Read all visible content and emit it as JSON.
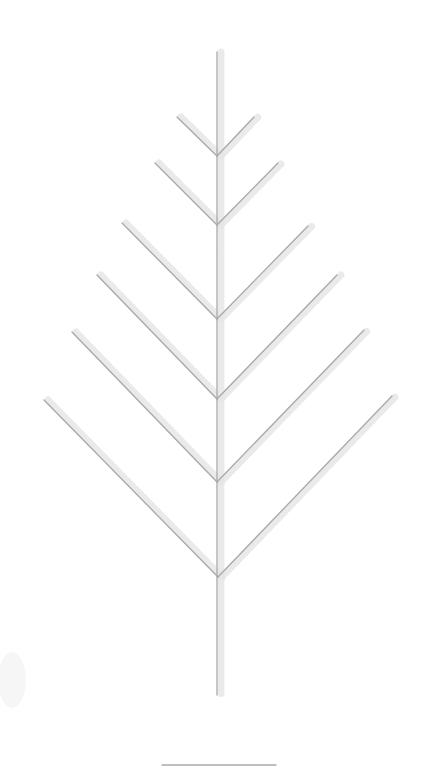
{
  "drawing": {
    "subject": "fern-leaf-sketch",
    "style": "pencil",
    "stroke_color": "#a9a9a9",
    "halo_color": "#e6e6e6",
    "background": "#ffffff",
    "stem": {
      "x1": 217,
      "y1": 52,
      "x2": 217,
      "y2": 695
    },
    "branch_pairs": [
      {
        "joint": [
          217,
          156
        ],
        "left": [
          177,
          117
        ],
        "right": [
          254,
          117
        ]
      },
      {
        "joint": [
          217,
          225
        ],
        "left": [
          155,
          163
        ],
        "right": [
          278,
          163
        ]
      },
      {
        "joint": [
          217,
          319
        ],
        "left": [
          122,
          223
        ],
        "right": [
          308,
          226
        ]
      },
      {
        "joint": [
          217,
          399
        ],
        "left": [
          97,
          275
        ],
        "right": [
          337,
          275
        ]
      },
      {
        "joint": [
          217,
          482
        ],
        "left": [
          72,
          332
        ],
        "right": [
          364,
          330
        ]
      },
      {
        "joint": [
          218,
          577
        ],
        "left": [
          44,
          400
        ],
        "right": [
          392,
          396
        ]
      }
    ],
    "base_line": {
      "x1": 162,
      "y1": 765,
      "x2": 276,
      "y2": 765
    }
  }
}
